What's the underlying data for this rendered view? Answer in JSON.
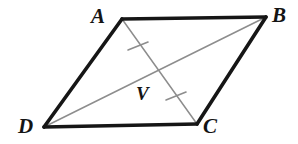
{
  "figure": {
    "kind": "geometry-diagram",
    "shape_name": "parallelogram",
    "background_color": "#ffffff",
    "width": 298,
    "height": 144
  },
  "style": {
    "side_color": "#161616",
    "side_width": 3.6,
    "diagonal_color": "#8d8d8d",
    "diagonal_width": 1.5,
    "tick_color": "#8d8d8d",
    "tick_width": 1.6,
    "label_color": "#141414"
  },
  "vertices": [
    {
      "id": "A",
      "label": "A",
      "x": 122,
      "y": 19,
      "label_x": 91,
      "label_y": 6
    },
    {
      "id": "B",
      "label": "B",
      "x": 266,
      "y": 17,
      "label_x": 272,
      "label_y": 5
    },
    {
      "id": "C",
      "label": "C",
      "x": 197,
      "y": 124,
      "label_x": 203,
      "label_y": 116
    },
    {
      "id": "D",
      "label": "D",
      "x": 44,
      "y": 127,
      "label_x": 18,
      "label_y": 116
    }
  ],
  "interior_points": [
    {
      "id": "V",
      "label": "V",
      "x": 155,
      "y": 72,
      "label_x": 136,
      "label_y": 84
    }
  ],
  "sides": [
    {
      "id": "AB",
      "from": "A",
      "to": "B",
      "x1": 122,
      "y1": 19,
      "x2": 266,
      "y2": 17
    },
    {
      "id": "BC",
      "from": "B",
      "to": "C",
      "x1": 266,
      "y1": 17,
      "x2": 197,
      "y2": 124
    },
    {
      "id": "CD",
      "from": "C",
      "to": "D",
      "x1": 197,
      "y1": 124,
      "x2": 44,
      "y2": 127
    },
    {
      "id": "DA",
      "from": "D",
      "to": "A",
      "x1": 44,
      "y1": 127,
      "x2": 122,
      "y2": 19
    }
  ],
  "diagonals": [
    {
      "id": "DB",
      "from": "D",
      "to": "B",
      "x1": 44,
      "y1": 127,
      "x2": 266,
      "y2": 17
    },
    {
      "id": "AC",
      "from": "A",
      "to": "C",
      "x1": 122,
      "y1": 19,
      "x2": 197,
      "y2": 124
    }
  ],
  "tick_marks": [
    {
      "id": "tick-AV",
      "on_segment": "AC",
      "cx": 138,
      "cy": 46,
      "x1": 128,
      "y1": 50,
      "x2": 148,
      "y2": 42
    },
    {
      "id": "tick-VC",
      "on_segment": "AC",
      "cx": 176,
      "cy": 96,
      "x1": 166,
      "y1": 100,
      "x2": 186,
      "y2": 92
    }
  ]
}
